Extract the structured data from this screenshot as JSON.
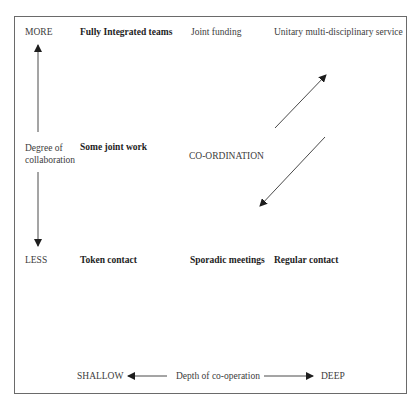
{
  "diagram": {
    "vertical_axis": {
      "top_label": "MORE",
      "bottom_label": "LESS",
      "title_line1": "Degree of",
      "title_line2": "collaboration"
    },
    "horizontal_axis": {
      "left_label": "SHALLOW",
      "right_label": "DEEP",
      "title": "Depth of co-operation"
    },
    "top_row": {
      "col1": "Fully Integrated teams",
      "col2": "Joint funding",
      "col3": "Unitary multi-disciplinary service"
    },
    "middle_row": {
      "col1": "Some joint work",
      "center": "CO-ORDINATION"
    },
    "bottom_row": {
      "col1": "Token contact",
      "col2": "Sporadic meetings",
      "col3": "Regular contact"
    },
    "colors": {
      "line": "#3a3a3a",
      "border": "#6a6a6a",
      "text": "#3c3c3c"
    }
  }
}
